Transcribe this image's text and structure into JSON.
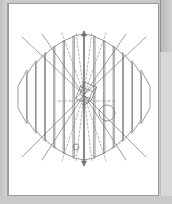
{
  "window": {
    "title": "CAD Viewport",
    "chrome": {
      "left_strip": "window-edge",
      "right_strip": "panel-divider",
      "bottom_strip": "window-edge"
    }
  },
  "viewport": {
    "name": "wireframe-viewport",
    "background_color": "#ffffff",
    "border_color": "#9a9a9a",
    "x": 8,
    "y": 3,
    "width": 151,
    "height": 193
  },
  "style": {
    "solid_line_color": "#6f6f6f",
    "dashed_line_color": "#8a8a8a",
    "axis_color": "#707070",
    "stroke_width": 0.7
  },
  "geometry": {
    "center": {
      "x": 84,
      "y": 97
    },
    "axis": {
      "name": "vertical-rotation-axis",
      "x": 84,
      "top_y": 31,
      "bottom_y": 166,
      "arrowhead_top": true,
      "arrowhead_bottom": true
    },
    "cube": {
      "name": "rotated-cube",
      "center_x": 84,
      "center_y": 95,
      "size": 13,
      "rotation_deg": 22
    },
    "circle_large": {
      "name": "construction-circle",
      "cx": 107,
      "cy": 113,
      "r": 8
    },
    "circle_small": {
      "name": "construction-point-circle",
      "cx": 76,
      "cy": 147,
      "r": 3
    },
    "dashed_horizontal": {
      "name": "horizontal-construction-line",
      "x1": 58,
      "x2": 115,
      "y": 101
    },
    "blades": {
      "name": "radial-blade-array",
      "count": 14,
      "description": "vertical parallelogram blades fanning left and right of the axis"
    },
    "radial_lines": {
      "name": "radial-construction-lines",
      "count": 12,
      "description": "solid and dashed rays from the cube center to the outer blade tips"
    }
  }
}
